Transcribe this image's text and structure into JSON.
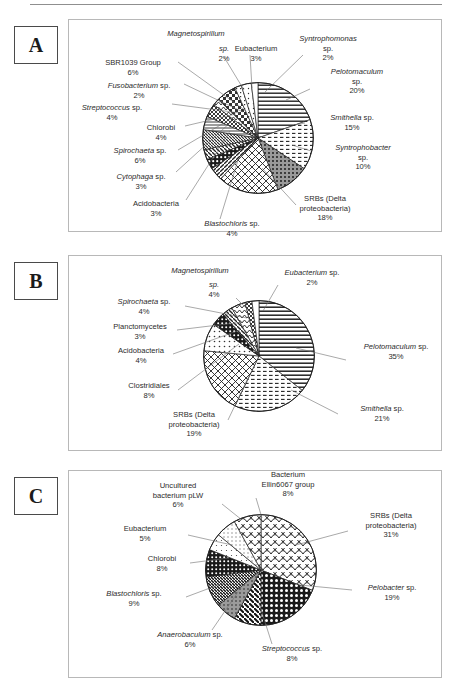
{
  "figure": {
    "panels": [
      {
        "letter": "A"
      },
      {
        "letter": "B"
      },
      {
        "letter": "C"
      }
    ]
  },
  "panel_a": {
    "labels": {
      "magnetospirillum": {
        "genus": "Magnetospirillum",
        "sp": "sp.",
        "pct": "2%"
      },
      "eubacterium": {
        "genus": "Eubacterium",
        "sp": "",
        "pct": "3%"
      },
      "syntrophomonas": {
        "genus": "Syntrophomonas",
        "sp": "sp.",
        "pct": "2%"
      },
      "pelotomaculum": {
        "genus": "Pelotomaculum",
        "sp": "sp.",
        "pct": "20%"
      },
      "smithella": {
        "genus": "Smithella",
        "sp": "sp.",
        "pct": "15%"
      },
      "syntrophobacter": {
        "genus": "Syntrophobacter",
        "sp": "sp.",
        "pct": "10%"
      },
      "srbs": {
        "genus": "SRBs (Delta",
        "sp": "proteobacteria)",
        "pct": "18%"
      },
      "blastochloris": {
        "genus": "Blastochloris",
        "sp": "sp.",
        "pct": "4%"
      },
      "acidobacteria": {
        "genus": "Acidobacteria",
        "sp": "",
        "pct": "3%"
      },
      "cytophaga": {
        "genus": "Cytophaga",
        "sp": "sp.",
        "pct": "3%"
      },
      "spirochaeta": {
        "genus": "Spirochaeta",
        "sp": "sp.",
        "pct": "6%"
      },
      "chlorobi": {
        "genus": "Chlorobi",
        "sp": "",
        "pct": "4%"
      },
      "streptococcus": {
        "genus": "Streptococcus",
        "sp": "sp.",
        "pct": "4%"
      },
      "fusobacterium": {
        "genus": "Fusobacterium",
        "sp": "sp.",
        "pct": "2%"
      },
      "sbr1039": {
        "genus": "SBR1039 Group",
        "sp": "",
        "pct": "6%"
      }
    }
  },
  "panel_b": {
    "labels": {
      "magnetospirillum": {
        "genus": "Magnetospirillum",
        "sp": "sp.",
        "pct": "4%"
      },
      "eubacterium": {
        "genus": "Eubacterium",
        "sp": "sp.",
        "pct": "2%"
      },
      "pelotomaculum": {
        "genus": "Pelotomaculum",
        "sp": "sp.",
        "pct": "35%"
      },
      "smithella": {
        "genus": "Smithella",
        "sp": "sp.",
        "pct": "21%"
      },
      "srbs": {
        "genus": "SRBs (Delta",
        "sp": "proteobacteria)",
        "pct": "19%"
      },
      "clostridiales": {
        "genus": "Clostridiales",
        "sp": "",
        "pct": "8%"
      },
      "acidobacteria": {
        "genus": "Acidobacteria",
        "sp": "",
        "pct": "4%"
      },
      "planctomycetes": {
        "genus": "Planctomycetes",
        "sp": "",
        "pct": "3%"
      },
      "spirochaeta": {
        "genus": "Spirochaeta",
        "sp": "sp.",
        "pct": "4%"
      }
    }
  },
  "panel_c": {
    "labels": {
      "ellin6067": {
        "genus": "Bacterium",
        "sp": "Ellin6067 group",
        "pct": "8%"
      },
      "srbs": {
        "genus": "SRBs (Delta",
        "sp": "proteobacteria)",
        "pct": "31%"
      },
      "pelobacter": {
        "genus": "Pelobacter",
        "sp": "sp.",
        "pct": "19%"
      },
      "streptococcus": {
        "genus": "Streptococcus",
        "sp": "sp.",
        "pct": "8%"
      },
      "anaerobaculum": {
        "genus": "Anaerobaculum",
        "sp": "sp.",
        "pct": "6%"
      },
      "blastochloris": {
        "genus": "Blastochloris",
        "sp": "sp.",
        "pct": "9%"
      },
      "chlorobi": {
        "genus": "Chlorobi",
        "sp": "",
        "pct": "8%"
      },
      "eubacterium": {
        "genus": "Eubacterium",
        "sp": "",
        "pct": "5%"
      },
      "uncultured": {
        "genus": "Uncultured",
        "sp": "bacterium pLW",
        "pct": "6%"
      }
    }
  },
  "chart_data": [
    {
      "type": "pie",
      "title": "A",
      "legend_position": "callout-labels",
      "unit": "percent",
      "categories": [
        "Pelotomaculum sp.",
        "Smithella sp.",
        "Syntrophobacter sp.",
        "SRBs (Delta proteobacteria)",
        "Blastochloris sp.",
        "Acidobacteria",
        "Cytophaga sp.",
        "Spirochaeta sp.",
        "Chlorobi",
        "Streptococcus sp.",
        "Fusobacterium sp.",
        "SBR1039 Group",
        "Magnetospirillum sp.",
        "Eubacterium",
        "Syntrophomonas sp."
      ],
      "values": [
        20,
        15,
        10,
        18,
        4,
        3,
        3,
        6,
        4,
        4,
        2,
        6,
        2,
        3,
        2
      ],
      "patterns": [
        "hlines",
        "hdash",
        "dark-dots",
        "diag-grid",
        "diag-right",
        "dots-dark",
        "diag-left",
        "diag-left-fine",
        "hlines-thin",
        "crosshatch",
        "zigzag",
        "checker",
        "dotted-sq",
        "speck",
        "white"
      ]
    },
    {
      "type": "pie",
      "title": "B",
      "legend_position": "callout-labels",
      "unit": "percent",
      "categories": [
        "Pelotomaculum sp.",
        "Smithella sp.",
        "SRBs (Delta proteobacteria)",
        "Clostridiales",
        "Acidobacteria",
        "Planctomycetes",
        "Spirochaeta sp.",
        "Magnetospirillum sp.",
        "Eubacterium sp."
      ],
      "values": [
        35,
        21,
        19,
        8,
        4,
        3,
        4,
        2,
        2
      ],
      "patterns": [
        "hlines",
        "hdash",
        "diag-grid",
        "dots",
        "dark-dots",
        "diag-left",
        "zigzag",
        "crosshatch",
        "white"
      ]
    },
    {
      "type": "pie",
      "title": "C",
      "legend_position": "callout-labels",
      "unit": "percent",
      "categories": [
        "SRBs (Delta proteobacteria)",
        "Pelobacter sp.",
        "Streptococcus sp.",
        "Anaerobaculum sp.",
        "Blastochloris sp.",
        "Chlorobi",
        "Eubacterium",
        "Uncultured bacterium pLW",
        "Bacterium Ellin6067 group"
      ],
      "values": [
        31,
        19,
        8,
        6,
        9,
        8,
        5,
        6,
        8
      ],
      "patterns": [
        "scale",
        "dark-checker",
        "diag-left-bold",
        "gray-dots",
        "diag-left-dense",
        "dark-dots2",
        "speck",
        "dotted-sq",
        "scale2"
      ]
    }
  ]
}
